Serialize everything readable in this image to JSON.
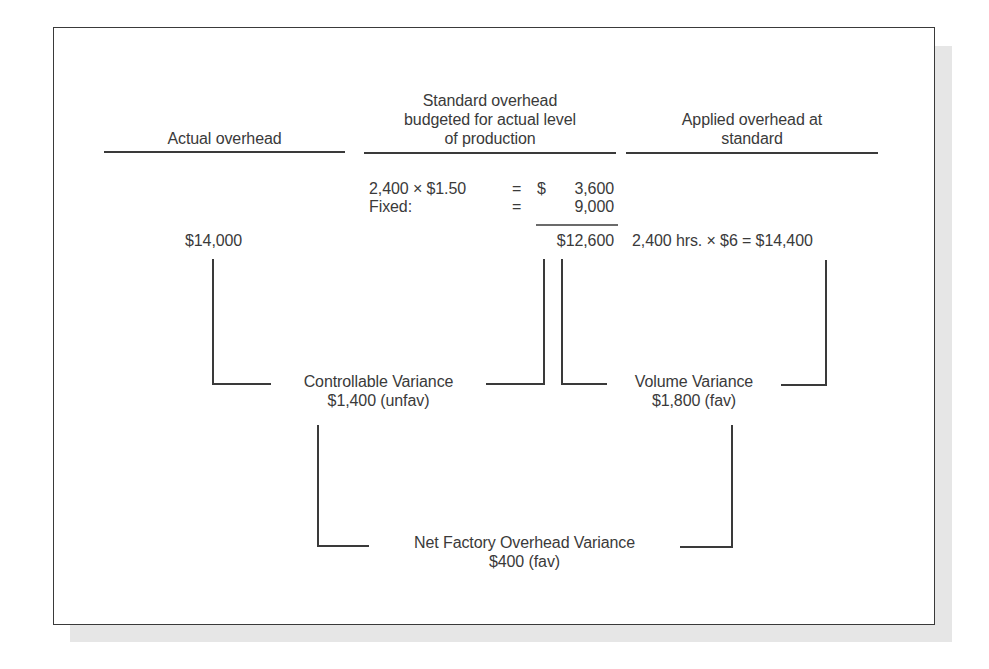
{
  "headers": {
    "actual": "Actual overhead",
    "budgeted_line1": "Standard overhead",
    "budgeted_line2": "budgeted for actual level",
    "budgeted_line3": "of production",
    "applied_line1": "Applied overhead at",
    "applied_line2": "standard"
  },
  "budget_calc": {
    "variable_label": "2,400 × $1.50",
    "variable_eq": "=",
    "variable_currency": "$",
    "variable_value": "3,600",
    "fixed_label": "Fixed:",
    "fixed_eq": "=",
    "fixed_value": "9,000",
    "total": "$12,600"
  },
  "actual_value": "$14,000",
  "applied_calc": "2,400 hrs. × $6 = $14,400",
  "variances": {
    "controllable_label": "Controllable Variance",
    "controllable_value": "$1,400 (unfav)",
    "volume_label": "Volume Variance",
    "volume_value": "$1,800 (fav)",
    "net_label": "Net Factory Overhead Variance",
    "net_value": "$400 (fav)"
  },
  "colors": {
    "line": "#3a3a3a",
    "text": "#3a3a3a",
    "shadow": "#e6e6e6"
  }
}
